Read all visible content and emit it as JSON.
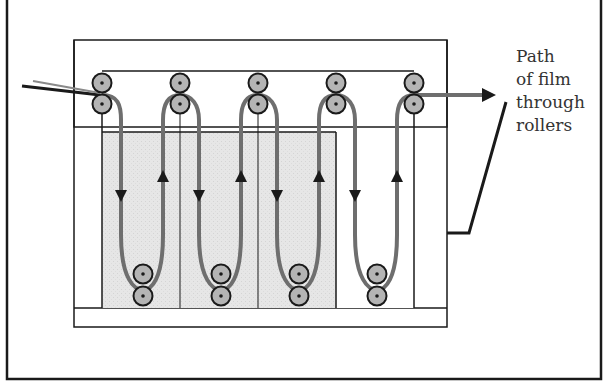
{
  "diagram": {
    "title_label": {
      "lines": [
        "Path",
        "of film",
        "through",
        "rollers"
      ]
    },
    "colors": {
      "line": "#1a1a1a",
      "film_path": "#6e6e6e",
      "solution_fill": "#e4e4e4",
      "roller_fill": "#b4b4b4",
      "background": "#ffffff"
    },
    "tanks": [
      {
        "name": "tank-1",
        "filled": true
      },
      {
        "name": "tank-2",
        "filled": true
      },
      {
        "name": "tank-3",
        "filled": true
      },
      {
        "name": "tank-4",
        "filled": false
      }
    ],
    "roller_columns": 5,
    "bottom_roller_pairs": 4
  }
}
